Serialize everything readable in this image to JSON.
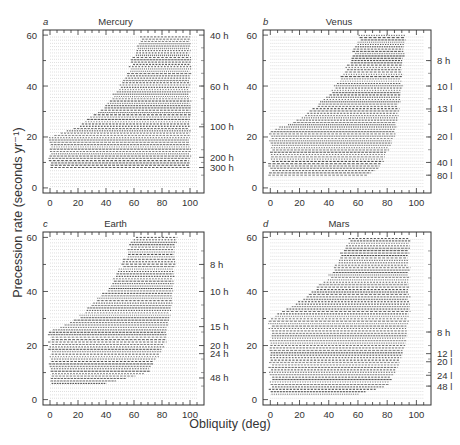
{
  "figure": {
    "ylabel": "Precession rate (seconds yr⁻¹)",
    "xlabel": "Obliquity (deg)"
  },
  "chart_data": {
    "type": "scatter",
    "xlabel": "Obliquity (deg)",
    "ylabel": "Precession rate (seconds yr^-1)",
    "xlim": [
      -5,
      110
    ],
    "ylim": [
      -2,
      62
    ],
    "xticks": [
      0,
      20,
      40,
      60,
      80,
      100
    ],
    "yticks": [
      0,
      20,
      40,
      60
    ],
    "grid": false,
    "legend": null,
    "panels": [
      {
        "letter": "a",
        "title": "Mercury",
        "right_axis_labels": [
          {
            "label": "40 h",
            "y": 60
          },
          {
            "label": "60 h",
            "y": 40
          },
          {
            "label": "100 h",
            "y": 24
          },
          {
            "label": "200 h",
            "y": 12
          },
          {
            "label": "300 h",
            "y": 8
          }
        ],
        "chaotic_zone_boundary": {
          "left_edge": [
            [
              0,
              8
            ],
            [
              0,
              20
            ],
            [
              20,
              24
            ],
            [
              40,
              32
            ],
            [
              55,
              44
            ],
            [
              62,
              55
            ],
            [
              66,
              60
            ]
          ],
          "right_edge": [
            [
              100,
              60
            ],
            [
              100,
              8
            ]
          ]
        }
      },
      {
        "letter": "b",
        "title": "Venus",
        "right_axis_labels": [
          {
            "label": "8 h",
            "y": 50
          },
          {
            "label": "10 l",
            "y": 40
          },
          {
            "label": "13 l",
            "y": 31
          },
          {
            "label": "20 l",
            "y": 20
          },
          {
            "label": "40 l",
            "y": 10
          },
          {
            "label": "80 l",
            "y": 5
          }
        ],
        "chaotic_zone_boundary": {
          "left_edge": [
            [
              0,
              5
            ],
            [
              0,
              22
            ],
            [
              20,
              27
            ],
            [
              40,
              36
            ],
            [
              52,
              46
            ],
            [
              58,
              55
            ],
            [
              62,
              60
            ]
          ],
          "right_edge": [
            [
              92,
              60
            ],
            [
              90,
              40
            ],
            [
              85,
              20
            ],
            [
              75,
              8
            ],
            [
              60,
              3
            ]
          ]
        }
      },
      {
        "letter": "c",
        "title": "Earth",
        "right_axis_labels": [
          {
            "label": "8 h",
            "y": 50
          },
          {
            "label": "10 h",
            "y": 40
          },
          {
            "label": "15 h",
            "y": 27
          },
          {
            "label": "20 h",
            "y": 20
          },
          {
            "label": "24 h",
            "y": 17
          },
          {
            "label": "48 h",
            "y": 8
          }
        ],
        "chaotic_zone_boundary": {
          "left_edge": [
            [
              0,
              6
            ],
            [
              0,
              25
            ],
            [
              20,
              30
            ],
            [
              40,
              40
            ],
            [
              52,
              50
            ],
            [
              60,
              60
            ]
          ],
          "right_edge": [
            [
              90,
              60
            ],
            [
              88,
              40
            ],
            [
              82,
              20
            ],
            [
              70,
              10
            ],
            [
              40,
              6
            ]
          ]
        }
      },
      {
        "letter": "d",
        "title": "Mars",
        "right_axis_labels": [
          {
            "label": "8 h",
            "y": 25
          },
          {
            "label": "12 l",
            "y": 17
          },
          {
            "label": "20 l",
            "y": 14
          },
          {
            "label": "24 l",
            "y": 9
          },
          {
            "label": "48 l",
            "y": 5
          }
        ],
        "chaotic_zone_boundary": {
          "left_edge": [
            [
              0,
              2
            ],
            [
              0,
              30
            ],
            [
              20,
              36
            ],
            [
              40,
              45
            ],
            [
              50,
              55
            ],
            [
              55,
              60
            ]
          ],
          "right_edge": [
            [
              95,
              60
            ],
            [
              95,
              30
            ],
            [
              90,
              15
            ],
            [
              80,
              5
            ],
            [
              60,
              2
            ]
          ]
        }
      }
    ]
  }
}
